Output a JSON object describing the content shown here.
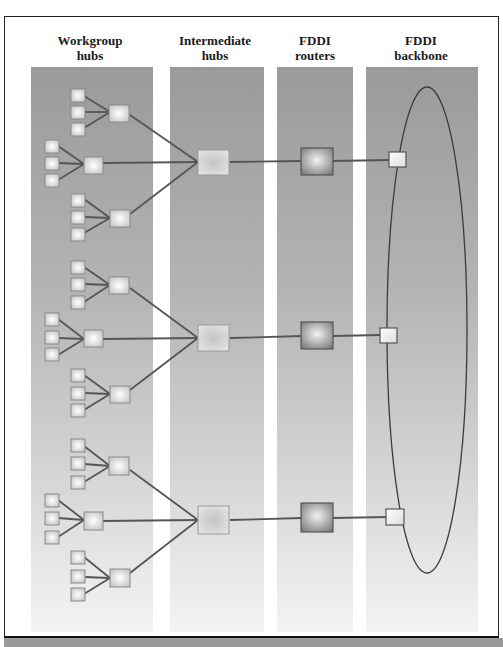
{
  "columns": [
    {
      "id": "workgroup",
      "label_line1": "Workgroup",
      "label_line2": "hubs"
    },
    {
      "id": "intermediate",
      "label_line1": "Intermediate",
      "label_line2": "hubs"
    },
    {
      "id": "routers",
      "label_line1": "FDDI",
      "label_line2": "routers"
    },
    {
      "id": "backbone",
      "label_line1": "FDDI",
      "label_line2": "backbone"
    }
  ],
  "colors": {
    "band_top": "#9a9a9a",
    "band_bottom": "#f4f4f4",
    "line": "#555555",
    "node_border": "#8a8a8a",
    "router_fill": "#8c8c8c"
  },
  "structure": {
    "groups": 3,
    "workgroup_hubs_per_group": 3,
    "devices_per_workgroup_hub": 3,
    "backbone_shape": "ellipse ring"
  }
}
